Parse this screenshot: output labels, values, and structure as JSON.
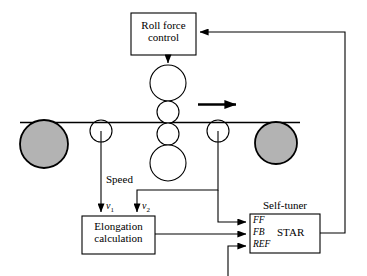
{
  "diagram": {
    "title_present": false,
    "type": "rolling-mill-control-block-diagram",
    "blocks": [
      {
        "id": "roll_force_control",
        "label_line1": "Roll force",
        "label_line2": "control",
        "x": 131,
        "y": 13,
        "w": 65,
        "h": 42
      },
      {
        "id": "elongation_calculation",
        "label_line1": "Elongation",
        "label_line2": "calculation",
        "x": 82,
        "y": 216,
        "w": 73,
        "h": 38
      },
      {
        "id": "self_tuner",
        "label": "Self-tuner",
        "inner_label": "STAR",
        "x": 250,
        "y": 214,
        "w": 70,
        "h": 39
      }
    ],
    "self_tuner_ports": [
      {
        "id": "ff",
        "label": "FF"
      },
      {
        "id": "fb",
        "label": "FB"
      },
      {
        "id": "ref",
        "label": "REF"
      }
    ],
    "signal_labels": [
      {
        "id": "speed",
        "label": "Speed"
      },
      {
        "id": "v1",
        "label": "v",
        "sub": "1"
      },
      {
        "id": "v2",
        "label": "v",
        "sub": "2"
      }
    ],
    "rolls": {
      "backup_top": {
        "cx": 168,
        "cy": 83,
        "r": 18,
        "fill": "#ffffff"
      },
      "work_top": {
        "cx": 168,
        "cy": 112,
        "r": 11,
        "fill": "#ffffff"
      },
      "work_bottom": {
        "cx": 168,
        "cy": 134,
        "r": 11,
        "fill": "#ffffff"
      },
      "backup_bottom": {
        "cx": 168,
        "cy": 163,
        "r": 18,
        "fill": "#ffffff"
      },
      "payoff_reel": {
        "cx": 44,
        "cy": 144,
        "r": 24,
        "fill": "#b3b3b3"
      },
      "tension_reel": {
        "cx": 276,
        "cy": 143,
        "r": 21,
        "fill": "#b3b3b3"
      },
      "measure_left": {
        "cx": 101,
        "cy": 131,
        "r": 11,
        "fill": "#ffffff"
      },
      "measure_right": {
        "cx": 218,
        "cy": 131,
        "r": 11,
        "fill": "#ffffff"
      }
    },
    "strip": {
      "y": 122,
      "x1": 20,
      "x2": 300
    },
    "direction_arrow": {
      "x1": 198,
      "x2": 240,
      "y": 104
    },
    "colors": {
      "line": "#000000",
      "roll_fill_gray": "#b3b3b3",
      "background": "#ffffff"
    }
  }
}
